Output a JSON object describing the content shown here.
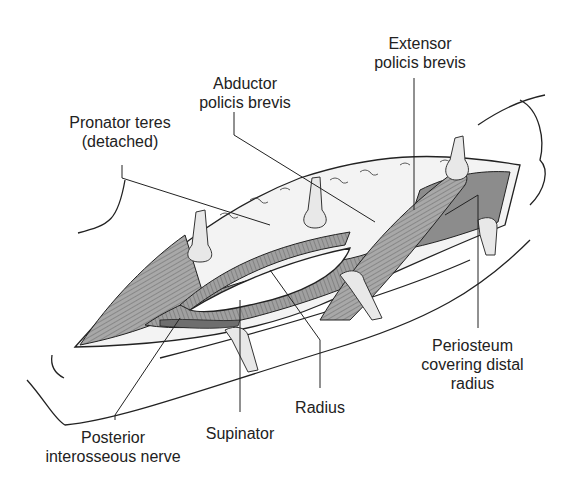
{
  "labels": {
    "extensor": [
      "Extensor",
      "policis brevis"
    ],
    "abductor": [
      "Abductor",
      "policis brevis"
    ],
    "pronator": [
      "Pronator teres",
      "(detached)"
    ],
    "periosteum": [
      "Periosteum",
      "covering distal",
      "radius"
    ],
    "radius": [
      "Radius"
    ],
    "supinator": [
      "Supinator"
    ],
    "posterior": [
      "Posterior",
      "interosseous nerve"
    ]
  },
  "colors": {
    "line": "#222222",
    "muscle": "#9a9a9a",
    "muscle_dark": "#7a7a7a",
    "periosteum": "#8c8c8c",
    "retractor": "#e6e6e6",
    "fat": "#f2f2f2",
    "bone": "#ffffff"
  }
}
